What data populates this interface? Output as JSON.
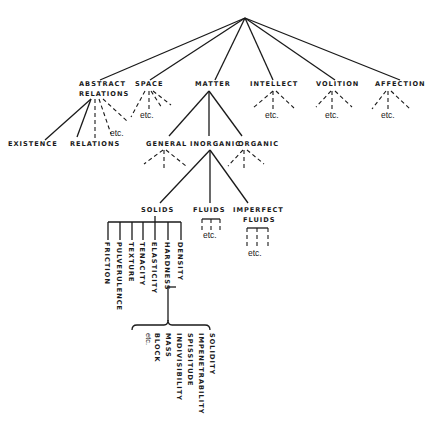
{
  "diagram": {
    "title": "",
    "level1": {
      "abstract_relations": [
        "ABSTRACT",
        "RELATIONS"
      ],
      "space": "SPACE",
      "matter": "MATTER",
      "intellect": "INTELLECT",
      "volition": "VOLITION",
      "affection": "AFFECTION"
    },
    "abstract_children": {
      "existence": "EXISTENCE",
      "relations": "RELATIONS",
      "etc": "etc."
    },
    "matter_children": {
      "general": "GENERAL",
      "inorganic": "INORGANIC",
      "organic": "ORGANIC"
    },
    "inorganic_children": {
      "solids": "SOLIDS",
      "fluids": "FLUIDS",
      "imperfect_fluids": [
        "IMPERFECT",
        "FLUIDS"
      ]
    },
    "solids_children": [
      "FRICTION",
      "PULVERULENCE",
      "TEXTURE",
      "TENACITY",
      "ELASTICITY",
      "HARDNESS",
      "DENSITY"
    ],
    "hardness_children": [
      "BLOCK",
      "MASS",
      "INDIVISIBILITY",
      "SPISSITUDE",
      "IMPENETRABILITY",
      "SOLIDITY"
    ],
    "etc_label": "etc."
  }
}
